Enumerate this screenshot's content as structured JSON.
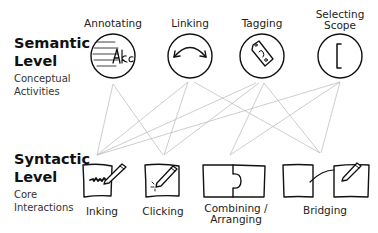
{
  "semantic_level": {
    "title_line1": "Semantic",
    "title_line2": "Level",
    "subtitle_line1": "Conceptual",
    "subtitle_line2": "Activities",
    "nodes": [
      {
        "id": "annotating",
        "label_line1": "Annotating",
        "label_line2": "",
        "icon": "annotation-text-icon"
      },
      {
        "id": "linking",
        "label_line1": "Linking",
        "label_line2": "",
        "icon": "link-arrow-icon"
      },
      {
        "id": "tagging",
        "label_line1": "Tagging",
        "label_line2": "",
        "icon": "tag-icon"
      },
      {
        "id": "selecting-scope",
        "label_line1": "Selecting",
        "label_line2": "Scope",
        "icon": "bracket-icon"
      }
    ]
  },
  "syntactic_level": {
    "title_line1": "Syntactic",
    "title_line2": "Level",
    "subtitle_line1": "Core",
    "subtitle_line2": "Interactions",
    "nodes": [
      {
        "id": "inking",
        "label_line1": "Inking",
        "label_line2": "",
        "icon": "pen-scribble-icon"
      },
      {
        "id": "clicking",
        "label_line1": "Clicking",
        "label_line2": "",
        "icon": "pen-click-icon"
      },
      {
        "id": "combining-arranging",
        "label_line1": "Combining /",
        "label_line2": "Arranging",
        "icon": "puzzle-pieces-icon"
      },
      {
        "id": "bridging",
        "label_line1": "Bridging",
        "label_line2": "",
        "icon": "bridge-pages-icon"
      }
    ]
  },
  "annotation_glyph": "Aʅc",
  "connections": [
    {
      "from": "annotating",
      "to": "inking"
    },
    {
      "from": "annotating",
      "to": "clicking"
    },
    {
      "from": "linking",
      "to": "inking"
    },
    {
      "from": "linking",
      "to": "clicking"
    },
    {
      "from": "linking",
      "to": "bridging"
    },
    {
      "from": "tagging",
      "to": "inking"
    },
    {
      "from": "tagging",
      "to": "clicking"
    },
    {
      "from": "tagging",
      "to": "combining-arranging"
    },
    {
      "from": "tagging",
      "to": "bridging"
    },
    {
      "from": "selecting-scope",
      "to": "inking"
    },
    {
      "from": "selecting-scope",
      "to": "combining-arranging"
    },
    {
      "from": "selecting-scope",
      "to": "bridging"
    }
  ],
  "colors": {
    "stroke": "#111111",
    "connector": "#b8b8b8",
    "text": "#222222"
  }
}
